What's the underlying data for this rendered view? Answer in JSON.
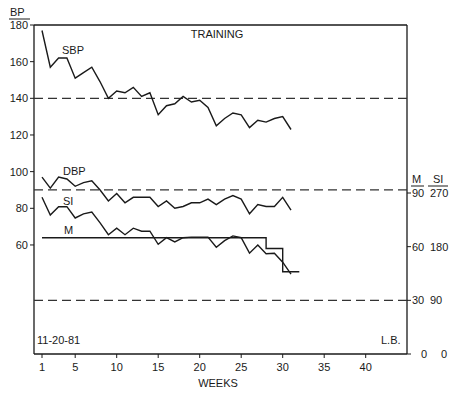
{
  "chart_data": {
    "type": "line",
    "title": "TRAINING",
    "xlabel": "WEEKS",
    "ylabel_left": "BP",
    "ylabel_right": [
      "M",
      "SI"
    ],
    "x_ticks": [
      1,
      5,
      10,
      15,
      20,
      25,
      30,
      35,
      40
    ],
    "x_range": [
      1,
      45
    ],
    "y_left_ticks": [
      60,
      80,
      100,
      120,
      140,
      160,
      180
    ],
    "y_left_range": [
      0,
      180
    ],
    "y_right_ticks_M": [
      0,
      30,
      60,
      90
    ],
    "y_right_ticks_SI": [
      0,
      90,
      180,
      270
    ],
    "reference_lines": [
      {
        "axis": "left",
        "value": 140,
        "style": "dashed"
      },
      {
        "axis": "left",
        "value": 90,
        "style": "dashed"
      },
      {
        "axis": "right_M",
        "value": 30,
        "style": "dashed"
      }
    ],
    "x": [
      1,
      2,
      3,
      4,
      5,
      6,
      7,
      8,
      9,
      10,
      11,
      12,
      13,
      14,
      15,
      16,
      17,
      18,
      19,
      20,
      21,
      22,
      23,
      24,
      25,
      26,
      27,
      28,
      29,
      30,
      31
    ],
    "series": [
      {
        "name": "SBP",
        "axis": "left",
        "values": [
          177,
          157,
          162,
          162,
          151,
          154,
          157,
          149,
          140,
          144,
          143,
          146,
          141,
          143,
          131,
          136,
          137,
          141,
          138,
          139,
          135,
          125,
          129,
          132,
          131,
          124,
          128,
          127,
          129,
          130,
          123
        ]
      },
      {
        "name": "DBP",
        "axis": "left",
        "values": [
          97,
          91,
          97,
          96,
          92,
          94,
          95,
          90,
          84,
          88,
          83,
          86,
          86,
          86,
          81,
          84,
          80,
          81,
          83,
          83,
          85,
          82,
          85,
          87,
          85,
          77,
          82,
          81,
          81,
          86,
          79
        ]
      },
      {
        "name": "SI",
        "axis": "right_SI",
        "values": [
          263,
          233,
          247,
          247,
          228,
          235,
          238,
          220,
          200,
          211,
          200,
          211,
          206,
          206,
          184,
          195,
          188,
          195,
          196,
          196,
          196,
          179,
          190,
          198,
          195,
          169,
          183,
          168,
          169,
          154,
          134
        ]
      },
      {
        "name": "M",
        "axis": "right_M",
        "type": "step",
        "steps": [
          {
            "from_week": 1,
            "to_week": 28,
            "value": 65
          },
          {
            "from_week": 28,
            "to_week": 30,
            "value": 59
          },
          {
            "from_week": 30,
            "to_week": 32,
            "value": 46
          }
        ]
      }
    ],
    "annotations": [
      "11-20-81",
      "L.B."
    ],
    "grid": false,
    "legend": "inline labels"
  },
  "labels": {
    "title": "TRAINING",
    "xlabel": "WEEKS",
    "ylabel_left": "BP",
    "ylabel_right_m": "M",
    "ylabel_right_si": "SI",
    "series_sbp": "SBP",
    "series_dbp": "DBP",
    "series_si": "SI",
    "series_m": "M",
    "date": "11-20-81",
    "initials": "L.B."
  }
}
